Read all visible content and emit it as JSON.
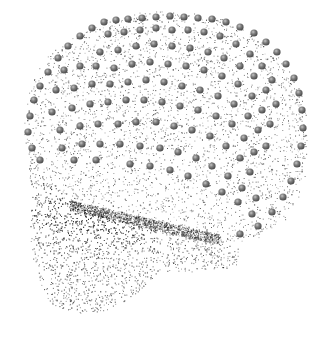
{
  "scene": {
    "subject": "skull point cloud with landmark spheres",
    "view": "lateral",
    "background": "#ffffff",
    "point_color": "#3a3a3a",
    "dense_color": "#1e1e1e",
    "marker_color": "#7a7a7a",
    "marker_highlight": "#b8b8b8",
    "marker_shadow": "#4a4a4a"
  },
  "shapes": {
    "vault": "M 30 150 C 22 110 30 70 70 40 C 110 14 170 8 215 20 C 262 32 296 70 304 120 C 310 160 300 200 278 222 C 262 236 240 242 220 238 L 150 228 C 110 222 70 200 45 180 Z",
    "face": "M 30 150 C 26 170 34 200 30 230 C 28 250 38 280 48 300 C 60 312 90 318 110 308 C 130 300 140 290 150 280 L 160 270 C 180 275 205 270 225 268 C 235 268 245 260 240 250 L 220 238 L 150 228 C 110 222 70 200 45 180 Z"
  },
  "markers": [
    [
      104,
      22
    ],
    [
      116,
      20
    ],
    [
      128,
      19
    ],
    [
      142,
      18
    ],
    [
      156,
      17
    ],
    [
      170,
      16
    ],
    [
      184,
      17
    ],
    [
      198,
      18
    ],
    [
      212,
      19
    ],
    [
      226,
      22
    ],
    [
      240,
      27
    ],
    [
      254,
      33
    ],
    [
      266,
      42
    ],
    [
      277,
      52
    ],
    [
      286,
      64
    ],
    [
      294,
      78
    ],
    [
      299,
      93
    ],
    [
      302,
      110
    ],
    [
      303,
      128
    ],
    [
      301,
      146
    ],
    [
      297,
      164
    ],
    [
      291,
      181
    ],
    [
      283,
      197
    ],
    [
      272,
      212
    ],
    [
      258,
      226
    ],
    [
      240,
      234
    ],
    [
      92,
      28
    ],
    [
      80,
      36
    ],
    [
      68,
      46
    ],
    [
      58,
      58
    ],
    [
      48,
      72
    ],
    [
      40,
      86
    ],
    [
      34,
      100
    ],
    [
      30,
      116
    ],
    [
      28,
      132
    ],
    [
      32,
      148
    ],
    [
      40,
      160
    ],
    [
      108,
      34
    ],
    [
      124,
      32
    ],
    [
      140,
      30
    ],
    [
      156,
      28
    ],
    [
      172,
      30
    ],
    [
      188,
      30
    ],
    [
      204,
      32
    ],
    [
      220,
      36
    ],
    [
      236,
      44
    ],
    [
      250,
      54
    ],
    [
      262,
      66
    ],
    [
      272,
      80
    ],
    [
      100,
      52
    ],
    [
      118,
      50
    ],
    [
      136,
      46
    ],
    [
      154,
      44
    ],
    [
      172,
      46
    ],
    [
      190,
      48
    ],
    [
      208,
      52
    ],
    [
      224,
      58
    ],
    [
      240,
      66
    ],
    [
      254,
      76
    ],
    [
      266,
      90
    ],
    [
      276,
      104
    ],
    [
      64,
      70
    ],
    [
      80,
      66
    ],
    [
      96,
      66
    ],
    [
      114,
      68
    ],
    [
      132,
      64
    ],
    [
      150,
      62
    ],
    [
      168,
      64
    ],
    [
      186,
      66
    ],
    [
      204,
      70
    ],
    [
      222,
      76
    ],
    [
      238,
      84
    ],
    [
      252,
      96
    ],
    [
      262,
      110
    ],
    [
      270,
      124
    ],
    [
      56,
      90
    ],
    [
      74,
      88
    ],
    [
      92,
      84
    ],
    [
      110,
      84
    ],
    [
      128,
      82
    ],
    [
      146,
      80
    ],
    [
      164,
      82
    ],
    [
      182,
      86
    ],
    [
      200,
      90
    ],
    [
      218,
      96
    ],
    [
      234,
      104
    ],
    [
      248,
      116
    ],
    [
      258,
      130
    ],
    [
      266,
      146
    ],
    [
      52,
      112
    ],
    [
      72,
      108
    ],
    [
      90,
      104
    ],
    [
      108,
      102
    ],
    [
      126,
      100
    ],
    [
      144,
      100
    ],
    [
      162,
      102
    ],
    [
      180,
      106
    ],
    [
      198,
      110
    ],
    [
      216,
      116
    ],
    [
      232,
      124
    ],
    [
      244,
      138
    ],
    [
      254,
      152
    ],
    [
      60,
      130
    ],
    [
      80,
      126
    ],
    [
      98,
      124
    ],
    [
      118,
      124
    ],
    [
      136,
      122
    ],
    [
      156,
      122
    ],
    [
      174,
      126
    ],
    [
      192,
      130
    ],
    [
      210,
      136
    ],
    [
      226,
      146
    ],
    [
      240,
      158
    ],
    [
      250,
      172
    ],
    [
      62,
      148
    ],
    [
      82,
      144
    ],
    [
      100,
      144
    ],
    [
      120,
      144
    ],
    [
      140,
      146
    ],
    [
      160,
      148
    ],
    [
      178,
      152
    ],
    [
      196,
      158
    ],
    [
      212,
      166
    ],
    [
      228,
      176
    ],
    [
      242,
      188
    ],
    [
      256,
      198
    ],
    [
      74,
      160
    ],
    [
      96,
      160
    ],
    [
      130,
      164
    ],
    [
      150,
      166
    ],
    [
      170,
      170
    ],
    [
      188,
      176
    ],
    [
      206,
      184
    ],
    [
      222,
      192
    ],
    [
      238,
      202
    ],
    [
      252,
      214
    ]
  ]
}
